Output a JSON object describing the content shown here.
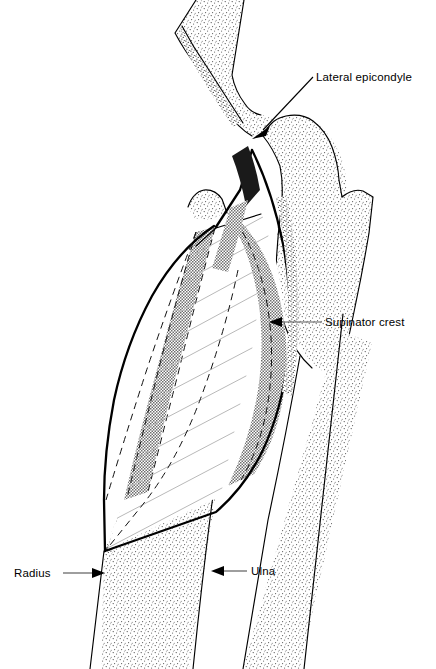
{
  "figure": {
    "background_color": "#ffffff",
    "line_color": "#000000",
    "bone_fill": "#f6f6f6",
    "muscle_band_color": "#8e8e8e",
    "hatch_color": "#b9b9b9",
    "leader_color": "#5d5d5d"
  },
  "labels": {
    "lateral_epicondyle": "Lateral epicondyle",
    "supinator_crest": "Supinator crest",
    "radius": "Radius",
    "ulna": "Ulna"
  },
  "structures": {
    "humerus": "humerus",
    "radius_bone": "radius",
    "ulna_bone": "ulna",
    "supinator_muscle": "supinator muscle",
    "olecranon": "olecranon",
    "radial_head": "radial head"
  }
}
